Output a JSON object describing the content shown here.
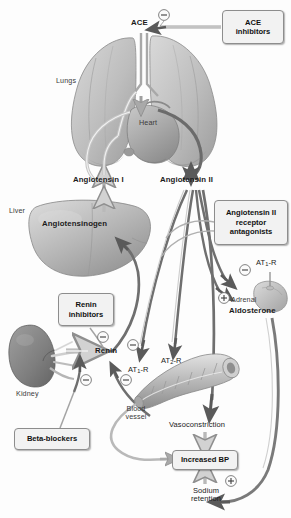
{
  "figure": {
    "type": "biomedical-pathway-diagram",
    "palette": {
      "background": "#fdfdfd",
      "organ_fill": "#b9b9b9",
      "organ_fill_light": "#d6d6d6",
      "organ_shadow": "#8a8a8a",
      "arrow_dark": "#5c5c5c",
      "arrow_light": "#b0b0b0",
      "box_fill": "#f2f2f2",
      "box_border": "#8d8d8d",
      "text": "#1b1b1b"
    }
  },
  "organs": {
    "lungs": "Lungs",
    "heart": "Heart",
    "liver": "Liver",
    "kidney": "Kidney",
    "adrenal": "Adrenal",
    "blood_vessel_line1": "Blood",
    "blood_vessel_line2": "vessel"
  },
  "molecules": {
    "ace": "ACE",
    "angiotensinogen": "Angiotensinogen",
    "angiotensin_i": "Angiotensin I",
    "angiotensin_ii": "Angiotensin II",
    "renin": "Renin",
    "aldosterone": "Aldosterone"
  },
  "receptors": {
    "at1r_adrenal_pre": "AT",
    "at1r_adrenal_sub": "1",
    "at1r_adrenal_post": "-R",
    "at1r_vessel_pre": "AT",
    "at1r_vessel_sub": "1",
    "at1r_vessel_post": "-R",
    "at2r_vessel_pre": "AT",
    "at2r_vessel_sub": "2",
    "at2r_vessel_post": "-R"
  },
  "drug_boxes": [
    {
      "id": "ace-inhibitors",
      "line1": "ACE",
      "line2": "inhibitors"
    },
    {
      "id": "arb",
      "line1": "Angiotensin II",
      "line2": "receptor",
      "line3": "antagonists"
    },
    {
      "id": "renin-inhibitors",
      "line1": "Renin",
      "line2": "inhibitors"
    },
    {
      "id": "beta-blockers",
      "line1": "Beta-blockers"
    }
  ],
  "outcome_boxes": [
    {
      "id": "increased-bp",
      "label": "Increased BP"
    }
  ],
  "effects": {
    "vasoconstriction": "Vasoconstriction",
    "sodium_retention_line1": "Sodium",
    "sodium_retention_line2": "retention"
  },
  "signs": {
    "inhibition": "−",
    "stimulation": "+",
    "inhibition_count": 6,
    "stimulation_count": 3
  }
}
